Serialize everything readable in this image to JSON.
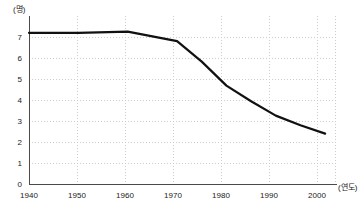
{
  "chart_data": {
    "type": "line",
    "title": "",
    "xlabel": "(연도)",
    "ylabel": "(명)",
    "x": [
      1940,
      1950,
      1960,
      1970,
      1980,
      1990,
      2000
    ],
    "categories": [
      "1940",
      "1950",
      "1960",
      "1970",
      "1980",
      "1990",
      "2000"
    ],
    "values": [
      6.3,
      6.3,
      6.35,
      5.95,
      4.1,
      2.85,
      2.1
    ],
    "series": [
      {
        "name": "평균 가구원 수",
        "values": [
          6.3,
          6.3,
          6.35,
          5.95,
          4.1,
          2.85,
          2.1
        ]
      }
    ],
    "detailed_points": [
      {
        "x": 1940,
        "y": 6.3
      },
      {
        "x": 1950,
        "y": 6.3
      },
      {
        "x": 1960,
        "y": 6.35
      },
      {
        "x": 1970,
        "y": 5.95
      },
      {
        "x": 1975,
        "y": 5.1
      },
      {
        "x": 1980,
        "y": 4.1
      },
      {
        "x": 1985,
        "y": 3.45
      },
      {
        "x": 1990,
        "y": 2.85
      },
      {
        "x": 1995,
        "y": 2.45
      },
      {
        "x": 2000,
        "y": 2.1
      }
    ],
    "xlim": [
      1940,
      2002
    ],
    "ylim": [
      0,
      7
    ],
    "y_ticks": [
      "0",
      "1",
      "2",
      "3",
      "4",
      "5",
      "6",
      "7"
    ],
    "x_ticks": [
      "1940",
      "1950",
      "1960",
      "1970",
      "1980",
      "1990",
      "2000"
    ],
    "grid": true,
    "grid_style": "dotted",
    "legend": "none",
    "line_color": "#111111",
    "grid_color": "#cccccc",
    "axis_color": "#4a4a4a",
    "background_color": "#ffffff"
  },
  "axes": {
    "y_unit": "(명)",
    "x_unit": "(연도)"
  }
}
